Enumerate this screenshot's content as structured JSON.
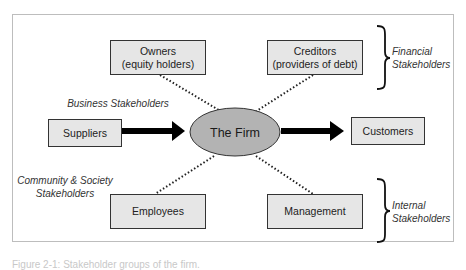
{
  "diagram": {
    "center": {
      "label": "The Firm"
    },
    "nodes": {
      "owners": {
        "line1": "Owners",
        "line2": "(equity holders)"
      },
      "creditors": {
        "line1": "Creditors",
        "line2": "(providers of debt)"
      },
      "suppliers": {
        "label": "Suppliers"
      },
      "customers": {
        "label": "Customers"
      },
      "employees": {
        "label": "Employees"
      },
      "management": {
        "label": "Management"
      }
    },
    "groups": {
      "financial": {
        "line1": "Financial",
        "line2": "Stakeholders"
      },
      "internal": {
        "line1": "Internal",
        "line2": "Stakeholders"
      },
      "business": {
        "label": "Business Stakeholders"
      },
      "community": {
        "line1": "Community & Society",
        "line2": "Stakeholders"
      }
    },
    "colors": {
      "box_fill": "#e6e6e6",
      "firm_fill": "#b3b3b3",
      "stroke": "#333333",
      "frame": "#bdbdbd"
    }
  },
  "caption": "Figure 2-1: Stakeholder groups of the firm."
}
